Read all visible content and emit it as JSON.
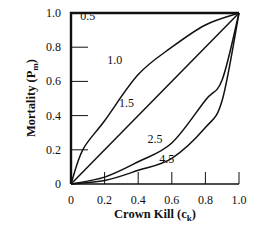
{
  "chart_data": {
    "type": "line",
    "title": "",
    "xlabel": "Crown Kill",
    "xlabel_sub": "k",
    "xlabel_var": "c",
    "ylabel": "Mortality",
    "ylabel_var": "P",
    "ylabel_sub": "m",
    "xlim": [
      0,
      1.0
    ],
    "ylim": [
      0,
      1.0
    ],
    "grid": false,
    "legend": "none",
    "x_ticks": [
      0,
      0.2,
      0.4,
      0.6,
      0.8,
      1.0
    ],
    "x_tick_labels": [
      "0",
      "0.2",
      "0.4",
      "0.6",
      "0.8",
      "1.0"
    ],
    "y_ticks": [
      0,
      0.2,
      0.4,
      0.6,
      0.8,
      1.0
    ],
    "y_tick_labels": [
      "0",
      "0.2",
      "0.4",
      "0.6",
      "0.8",
      "1.0"
    ],
    "series": [
      {
        "name": "0.5",
        "x": [
          0,
          0,
          1.0
        ],
        "y": [
          0,
          1.0,
          1.0
        ],
        "label_at": [
          0.1,
          0.96
        ]
      },
      {
        "name": "1.0",
        "x": [
          0,
          0.07,
          0.2,
          0.4,
          0.6,
          0.8,
          1.0
        ],
        "y": [
          0,
          0.2,
          0.37,
          0.64,
          0.8,
          0.93,
          1.0
        ],
        "label_at": [
          0.26,
          0.7
        ]
      },
      {
        "name": "1.5",
        "x": [
          0,
          1.0
        ],
        "y": [
          0,
          1.0
        ],
        "label_at": [
          0.33,
          0.45
        ]
      },
      {
        "name": "2.5",
        "x": [
          0,
          0.2,
          0.4,
          0.6,
          0.8,
          0.9,
          1.0
        ],
        "y": [
          0,
          0.04,
          0.13,
          0.24,
          0.49,
          0.61,
          1.0
        ],
        "label_at": [
          0.5,
          0.24
        ]
      },
      {
        "name": "4.5",
        "x": [
          0,
          0.2,
          0.4,
          0.6,
          0.8,
          0.9,
          1.0
        ],
        "y": [
          0,
          0.02,
          0.08,
          0.15,
          0.33,
          0.49,
          1.0
        ],
        "label_at": [
          0.57,
          0.12
        ]
      }
    ]
  }
}
